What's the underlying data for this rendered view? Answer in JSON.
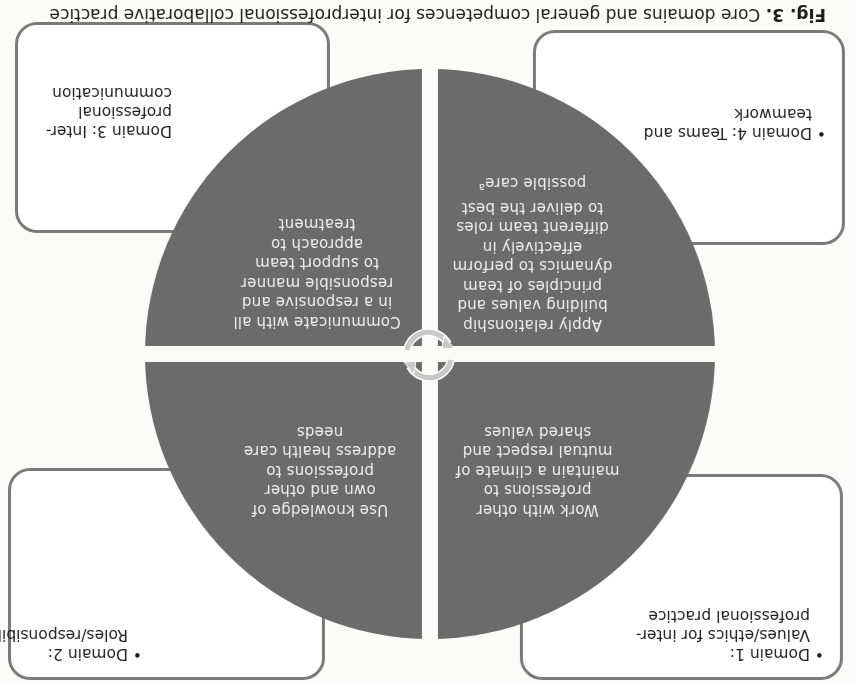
{
  "caption": {
    "figure_label": "Fig. 3.",
    "text": "Core domains and general competences for interprofessional collaborative practice"
  },
  "domains": [
    {
      "id": 1,
      "title": "Domain 1:",
      "subtitle_lines": [
        "Values/ethics for inter-",
        "professional practice"
      ],
      "bulleted": true,
      "competence_lines": [
        "Work with other",
        "professions to",
        "maintain a climate of",
        "mutual respect and",
        "shared values"
      ]
    },
    {
      "id": 2,
      "title": "Domain 2:",
      "subtitle_lines": [
        "Roles/responsibilities"
      ],
      "bulleted": true,
      "competence_lines": [
        "Use knowledge of",
        "own and other",
        "professions to",
        "address health care",
        "needs"
      ]
    },
    {
      "id": 3,
      "title": "Domain 3: Inter-",
      "subtitle_lines": [
        "professional",
        "communication"
      ],
      "bulleted": false,
      "competence_lines": [
        "Communicate with all",
        "in a responsive and",
        "responsible manner",
        "to support team",
        "approach to",
        "treatment"
      ]
    },
    {
      "id": 4,
      "title": "Domain 4: Teams and",
      "subtitle_lines": [
        "teamwork"
      ],
      "bulleted": true,
      "competence_lines": [
        "Apply relationship",
        "building values and",
        "principles of team",
        "dynamics to perform",
        "effectively in",
        "different team roles",
        "to deliver the best",
        "possible care"
      ],
      "footnote_marker": "a"
    }
  ],
  "center_icon": "cycle-arrows-icon",
  "colors": {
    "quadrant_fill": "#6b6b6b",
    "quadrant_text": "#efefef",
    "box_border": "#7a7a7a",
    "cycle_ring": "#c8c8c8"
  },
  "orientation": "rotated 180 degrees"
}
